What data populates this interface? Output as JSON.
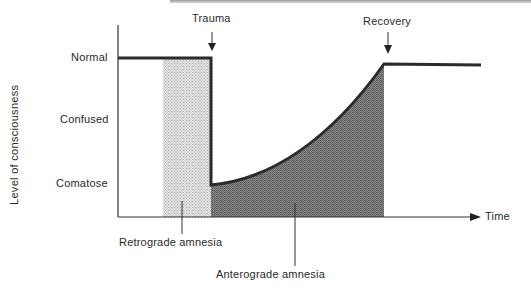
{
  "diagram": {
    "y_axis_label": "Level of consciousness",
    "y_levels": [
      "Normal",
      "Confused",
      "Comatose"
    ],
    "x_axis_label": "Time",
    "events": {
      "trauma": "Trauma",
      "recovery": "Recovery"
    },
    "regions": {
      "retrograde": "Retrograde  amnesia",
      "anterograde": "Anterograde  amnesia"
    },
    "colors": {
      "line": "#2b2b2b",
      "retrograde_fill": "#d4d4d4",
      "anterograde_fill": "#7a7a7a"
    }
  }
}
